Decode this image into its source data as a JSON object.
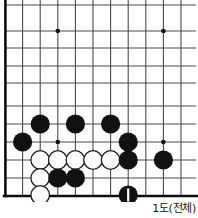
{
  "figure": {
    "kind": "go-board-diagram",
    "caption": "1도(전체)",
    "width": 198,
    "height": 218
  },
  "board": {
    "origin_x": 5,
    "origin_y": 5,
    "spacing": 17.6,
    "cols": 11,
    "rows": 12,
    "line_color": "#3a3a3a",
    "edge_color": "#0d0d0d",
    "background": "#ffffff",
    "edges": {
      "left": true,
      "bottom": true,
      "top": false,
      "right": false
    },
    "star_points": [
      {
        "col": 3,
        "row": 1.5
      },
      {
        "col": 9,
        "row": 1.5
      },
      {
        "col": 3,
        "row": 7.8
      },
      {
        "col": 9,
        "row": 7.8
      }
    ],
    "stone_radius": 9.2,
    "black_color": "#111111",
    "white_color": "#ffffff",
    "white_border_color": "#222222"
  },
  "stones": {
    "black": [
      {
        "x": 40,
        "y": 124
      },
      {
        "x": 75,
        "y": 124
      },
      {
        "x": 111,
        "y": 124
      },
      {
        "x": 22,
        "y": 142
      },
      {
        "x": 129,
        "y": 142
      },
      {
        "x": 129,
        "y": 160
      },
      {
        "x": 164,
        "y": 160
      },
      {
        "x": 57,
        "y": 178
      },
      {
        "x": 75,
        "y": 178
      }
    ],
    "white": [
      {
        "x": 40,
        "y": 160
      },
      {
        "x": 57,
        "y": 160
      },
      {
        "x": 75,
        "y": 160
      },
      {
        "x": 93,
        "y": 160
      },
      {
        "x": 111,
        "y": 160
      },
      {
        "x": 40,
        "y": 178
      },
      {
        "x": 40,
        "y": 196
      }
    ],
    "marked": [
      {
        "x": 129,
        "y": 196,
        "color": "black",
        "label": "1",
        "mark": "white-stroke"
      }
    ]
  },
  "lines": {
    "vertical_x": [
      5,
      22.6,
      40.2,
      57.8,
      75.4,
      93,
      110.6,
      128.2,
      145.8,
      163.4,
      181
    ],
    "horizontal_y": [
      5,
      13.8,
      31,
      48.4,
      65.8,
      83.2,
      100.6,
      124,
      142,
      160,
      178,
      196
    ]
  }
}
